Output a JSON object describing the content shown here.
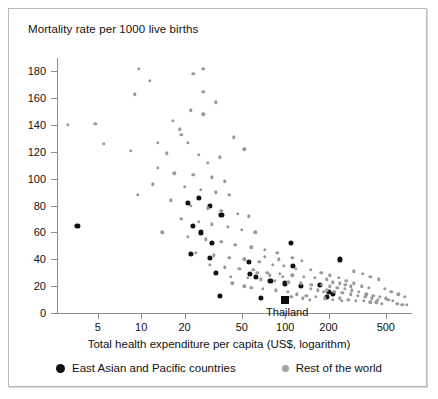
{
  "chart_data": {
    "type": "scatter",
    "title": "Mortality rate per 1000 live births",
    "xlabel": "Total health expenditure per capita (US$, logarithm)",
    "ylabel": "Mortality rate per 1000 live births",
    "xscale": "log",
    "xlim": [
      2.6,
      760
    ],
    "ylim": [
      0,
      190
    ],
    "xticks": [
      5,
      10,
      20,
      50,
      100,
      200,
      500
    ],
    "xtick_labels": [
      "5",
      "10",
      "20",
      "50",
      "100",
      "200",
      "500"
    ],
    "yticks": [
      0,
      20,
      40,
      60,
      80,
      100,
      120,
      140,
      160,
      180
    ],
    "ytick_labels": [
      "0",
      "20",
      "40",
      "60",
      "80",
      "100",
      "120",
      "140",
      "160",
      "180"
    ],
    "grid": false,
    "legend_position": "below-axis",
    "annotations": [
      {
        "label": "Thailand",
        "x": 100,
        "y": 10,
        "marker": "black-square"
      }
    ],
    "series": [
      {
        "name": "East Asian and Pacific countries",
        "color": "#111111",
        "marker": "circle",
        "points": [
          [
            3.6,
            65
          ],
          [
            21,
            82
          ],
          [
            25,
            86
          ],
          [
            30,
            80
          ],
          [
            23,
            65
          ],
          [
            26,
            60
          ],
          [
            36,
            73
          ],
          [
            31,
            52
          ],
          [
            22,
            44
          ],
          [
            30,
            41
          ],
          [
            33,
            30
          ],
          [
            35,
            13
          ],
          [
            56,
            38
          ],
          [
            57,
            29
          ],
          [
            63,
            27
          ],
          [
            79,
            24
          ],
          [
            100,
            22
          ],
          [
            110,
            52
          ],
          [
            113,
            35
          ],
          [
            128,
            20
          ],
          [
            175,
            21
          ],
          [
            200,
            16
          ],
          [
            215,
            14
          ],
          [
            240,
            40
          ],
          [
            196,
            12
          ],
          [
            68,
            11
          ]
        ]
      },
      {
        "name": "Rest of the world",
        "color": "#9a9a9a",
        "marker": "circle",
        "points": [
          [
            3.1,
            140
          ],
          [
            4.8,
            141
          ],
          [
            9.6,
            182
          ],
          [
            11.5,
            173
          ],
          [
            9.0,
            163
          ],
          [
            16.5,
            143
          ],
          [
            18.5,
            137
          ],
          [
            23,
            178
          ],
          [
            27,
            182
          ],
          [
            27,
            165
          ],
          [
            33,
            157
          ],
          [
            22,
            151
          ],
          [
            27,
            148
          ],
          [
            13,
            127
          ],
          [
            19,
            133
          ],
          [
            21,
            127
          ],
          [
            5.5,
            126
          ],
          [
            8.5,
            121
          ],
          [
            15,
            119
          ],
          [
            25,
            118
          ],
          [
            29,
            112
          ],
          [
            35,
            116
          ],
          [
            13,
            108
          ],
          [
            17,
            104
          ],
          [
            23,
            103
          ],
          [
            31,
            101
          ],
          [
            38,
            98
          ],
          [
            44,
            131
          ],
          [
            52,
            122
          ],
          [
            12,
            96
          ],
          [
            20,
            94
          ],
          [
            26,
            92
          ],
          [
            33,
            90
          ],
          [
            41,
            88
          ],
          [
            9.5,
            88
          ],
          [
            16,
            84
          ],
          [
            22,
            80
          ],
          [
            29,
            78
          ],
          [
            36,
            76
          ],
          [
            47,
            74
          ],
          [
            56,
            72
          ],
          [
            19,
            70
          ],
          [
            25,
            68
          ],
          [
            31,
            66
          ],
          [
            40,
            64
          ],
          [
            50,
            62
          ],
          [
            62,
            60
          ],
          [
            14,
            60
          ],
          [
            21,
            57
          ],
          [
            28,
            55
          ],
          [
            36,
            53
          ],
          [
            45,
            51
          ],
          [
            58,
            49
          ],
          [
            72,
            47
          ],
          [
            88,
            45
          ],
          [
            24,
            45
          ],
          [
            32,
            43
          ],
          [
            41,
            41
          ],
          [
            52,
            40
          ],
          [
            66,
            38
          ],
          [
            82,
            36
          ],
          [
            98,
            35
          ],
          [
            118,
            33
          ],
          [
            30,
            36
          ],
          [
            38,
            34
          ],
          [
            48,
            33
          ],
          [
            60,
            32
          ],
          [
            75,
            30
          ],
          [
            92,
            29
          ],
          [
            112,
            28
          ],
          [
            135,
            27
          ],
          [
            160,
            26
          ],
          [
            42,
            27
          ],
          [
            55,
            26
          ],
          [
            68,
            25
          ],
          [
            85,
            24
          ],
          [
            105,
            23
          ],
          [
            128,
            22
          ],
          [
            152,
            21
          ],
          [
            180,
            21
          ],
          [
            205,
            20
          ],
          [
            230,
            19
          ],
          [
            150,
            32
          ],
          [
            178,
            30
          ],
          [
            205,
            28
          ],
          [
            235,
            26
          ],
          [
            265,
            24
          ],
          [
            300,
            22
          ],
          [
            340,
            20
          ],
          [
            380,
            19
          ],
          [
            195,
            17
          ],
          [
            220,
            16
          ],
          [
            250,
            15
          ],
          [
            285,
            14
          ],
          [
            320,
            13
          ],
          [
            360,
            12
          ],
          [
            400,
            11
          ],
          [
            440,
            10
          ],
          [
            240,
            11
          ],
          [
            275,
            10
          ],
          [
            310,
            9
          ],
          [
            350,
            9
          ],
          [
            390,
            8
          ],
          [
            430,
            8
          ],
          [
            470,
            7
          ],
          [
            520,
            10
          ],
          [
            560,
            9
          ],
          [
            600,
            7
          ],
          [
            650,
            6
          ],
          [
            700,
            6
          ],
          [
            195,
            25
          ],
          [
            215,
            23
          ],
          [
            240,
            22
          ],
          [
            262,
            21
          ],
          [
            285,
            20
          ],
          [
            150,
            18
          ],
          [
            168,
            17
          ],
          [
            185,
            16
          ],
          [
            260,
            18
          ],
          [
            290,
            17
          ],
          [
            325,
            16
          ],
          [
            365,
            14
          ],
          [
            410,
            13
          ],
          [
            455,
            12
          ],
          [
            500,
            11
          ],
          [
            112,
            41
          ],
          [
            130,
            39
          ],
          [
            58,
            19
          ],
          [
            70,
            18
          ],
          [
            86,
            17
          ],
          [
            104,
            16
          ],
          [
            64,
            30
          ],
          [
            78,
            28
          ],
          [
            96,
            27
          ],
          [
            120,
            14
          ],
          [
            140,
            13
          ],
          [
            163,
            12
          ],
          [
            188,
            11
          ],
          [
            215,
            10
          ],
          [
            248,
            9
          ],
          [
            72,
            42
          ],
          [
            90,
            40
          ],
          [
            110,
            12
          ],
          [
            132,
            11
          ],
          [
            148,
            10
          ],
          [
            43,
            22
          ],
          [
            52,
            20
          ],
          [
            300,
            31
          ],
          [
            345,
            29
          ],
          [
            390,
            27
          ],
          [
            445,
            25
          ],
          [
            490,
            18
          ],
          [
            545,
            16
          ],
          [
            610,
            14
          ],
          [
            680,
            12
          ]
        ]
      }
    ]
  }
}
